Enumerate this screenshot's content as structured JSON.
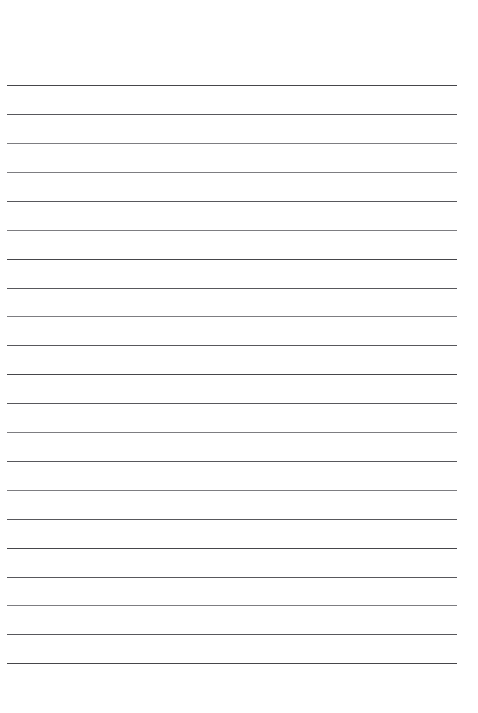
{
  "document": {
    "type": "lined-paper-scan",
    "title": "Blank Lined Notebook Page",
    "page_width": 478,
    "page_height": 713,
    "background_color": "#ffffff",
    "content_text": "",
    "has_handwriting": false,
    "has_printed_text": false
  },
  "ruling": {
    "line_color": "#4a4a4e",
    "line_thickness_px": 1,
    "line_count": 21,
    "line_left_x": 7,
    "line_right_x": 457,
    "line_length_px": 450,
    "line_spacing_px": 28.9,
    "first_line_y": 85,
    "last_line_y": 663,
    "lines": [
      {
        "index": 1,
        "y": 85,
        "weight": "dark"
      },
      {
        "index": 2,
        "y": 114,
        "weight": "normal"
      },
      {
        "index": 3,
        "y": 143,
        "weight": "light"
      },
      {
        "index": 4,
        "y": 172,
        "weight": "light"
      },
      {
        "index": 5,
        "y": 201,
        "weight": "normal"
      },
      {
        "index": 6,
        "y": 230,
        "weight": "light"
      },
      {
        "index": 7,
        "y": 259,
        "weight": "dark"
      },
      {
        "index": 8,
        "y": 288,
        "weight": "normal"
      },
      {
        "index": 9,
        "y": 316,
        "weight": "light"
      },
      {
        "index": 10,
        "y": 345,
        "weight": "normal"
      },
      {
        "index": 11,
        "y": 374,
        "weight": "dark"
      },
      {
        "index": 12,
        "y": 403,
        "weight": "normal"
      },
      {
        "index": 13,
        "y": 432,
        "weight": "light"
      },
      {
        "index": 14,
        "y": 461,
        "weight": "normal"
      },
      {
        "index": 15,
        "y": 490,
        "weight": "light"
      },
      {
        "index": 16,
        "y": 519,
        "weight": "normal"
      },
      {
        "index": 17,
        "y": 548,
        "weight": "dark"
      },
      {
        "index": 18,
        "y": 577,
        "weight": "normal"
      },
      {
        "index": 19,
        "y": 605,
        "weight": "light"
      },
      {
        "index": 20,
        "y": 634,
        "weight": "normal"
      },
      {
        "index": 21,
        "y": 663,
        "weight": "dark"
      }
    ]
  },
  "margins": {
    "top_margin_height": 85,
    "bottom_margin_height": 49,
    "left_margin_width": 7,
    "right_margin_width": 21,
    "top_margin_label": "",
    "bottom_margin_label": ""
  }
}
